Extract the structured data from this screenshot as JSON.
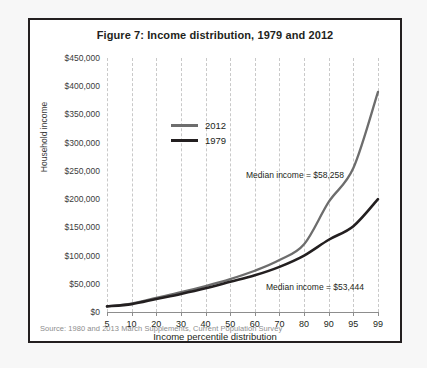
{
  "figure": {
    "title": "Figure 7: Income distribution, 1979 and 2012",
    "source": "Source: 1980 and 2013 March Supplements, Current Population Survey"
  },
  "annotations": {
    "median_2012": "Median income = $58,258",
    "median_1979": "Median income = $53,444"
  },
  "colors": {
    "series_2012": "#6d6d6d",
    "series_1979": "#231f20",
    "grid": "#c9c9c9",
    "axis": "#8d8d8d",
    "frame": "#231f20",
    "page": "#f7f7f7"
  },
  "chart_data": {
    "type": "line",
    "title": "Figure 7: Income distribution, 1979 and 2012",
    "xlabel": "Income percentile distribution",
    "ylabel": "Household income",
    "categories": [
      "5",
      "10",
      "20",
      "30",
      "40",
      "50",
      "60",
      "70",
      "80",
      "90",
      "95",
      "99"
    ],
    "ytick_labels": [
      "$0",
      "$50,000",
      "$100,000",
      "$150,000",
      "$200,000",
      "$250,000",
      "$300,000",
      "$350,000",
      "$400,000",
      "$450,000"
    ],
    "ytick_values": [
      0,
      50000,
      100000,
      150000,
      200000,
      250000,
      300000,
      350000,
      400000,
      450000
    ],
    "ylim": [
      0,
      450000
    ],
    "grid": "vertical-dashed",
    "legend_position": "upper-left-inside",
    "series": [
      {
        "name": "2012",
        "color": "#6d6d6d",
        "values": [
          10000,
          15000,
          25000,
          35000,
          46000,
          58258,
          73000,
          92000,
          120000,
          195000,
          255000,
          390000
        ]
      },
      {
        "name": "1979",
        "color": "#231f20",
        "values": [
          10000,
          14000,
          23000,
          32000,
          42000,
          53444,
          65000,
          80000,
          100000,
          128000,
          152000,
          200000
        ]
      }
    ],
    "annotations": [
      {
        "text": "Median income = $58,258",
        "series": "2012"
      },
      {
        "text": "Median income = $53,444",
        "series": "1979"
      }
    ]
  }
}
